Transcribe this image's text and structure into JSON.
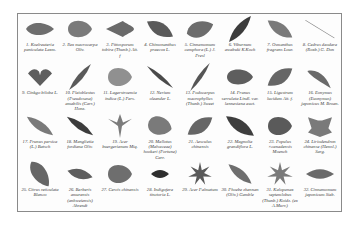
{
  "figure": {
    "specimens": [
      {
        "n": "1. Koelreuteria paniculata Laxm.",
        "shape": "ovate",
        "color": "#6e6e6e",
        "rot": 0,
        "w": 28,
        "h": 14
      },
      {
        "n": "2. Ilex macrocarpa Oliv.",
        "shape": "round",
        "color": "#7a7a7a",
        "rot": 0,
        "w": 24,
        "h": 20
      },
      {
        "n": "3. Pittosporum tobira (Thunb.) Ait. f",
        "shape": "arrow",
        "color": "#6a6a6a",
        "rot": 0,
        "w": 28,
        "h": 16
      },
      {
        "n": "4. Chimonanthus praecox L.",
        "shape": "elliptic",
        "color": "#5a5a5a",
        "rot": 30,
        "w": 30,
        "h": 16
      },
      {
        "n": "5. Cinnamomum camphora (L.) J. Presl",
        "shape": "ovate",
        "color": "#6c6c6c",
        "rot": -20,
        "w": 28,
        "h": 18
      },
      {
        "n": "6. Viburnum awabuki K.Koch",
        "shape": "lanceolate",
        "color": "#3c3c3c",
        "rot": -50,
        "w": 34,
        "h": 12
      },
      {
        "n": "7. Osmanthus fragrans Lour.",
        "shape": "elliptic",
        "color": "#7a7a7a",
        "rot": 35,
        "w": 30,
        "h": 14
      },
      {
        "n": "8. Cedrus deodara (Roxb.) G. Don",
        "shape": "needle",
        "color": "#7d7d7d",
        "rot": 30,
        "w": 34,
        "h": 2
      },
      {
        "n": "9. Ginkgo biloba L.",
        "shape": "fan",
        "color": "#5e5e5e",
        "rot": 0,
        "w": 24,
        "h": 18
      },
      {
        "n": "10. Pleioblastus (Pseudosasa) amabilis (Carr.) Honz.",
        "shape": "lanceolate",
        "color": "#5a5a5a",
        "rot": -50,
        "w": 34,
        "h": 8
      },
      {
        "n": "11. Lagerstroemia indica (L.) Pers.",
        "shape": "round",
        "color": "#909090",
        "rot": 0,
        "w": 24,
        "h": 22
      },
      {
        "n": "12. Nerium oleander L.",
        "shape": "lanceolate",
        "color": "#4a4a4a",
        "rot": 40,
        "w": 34,
        "h": 6
      },
      {
        "n": "13. Podocarpus macrophyllus (Thunb.) Sweet",
        "shape": "lanceolate",
        "color": "#555555",
        "rot": -55,
        "w": 34,
        "h": 6
      },
      {
        "n": "14. Prunus serrulata Lindl. var. lannesiana auct.",
        "shape": "round",
        "color": "#5e5e5e",
        "rot": 0,
        "w": 26,
        "h": 18
      },
      {
        "n": "15. Ligustrum lucidum Ait. f.",
        "shape": "elliptic",
        "color": "#666666",
        "rot": -35,
        "w": 30,
        "h": 16
      },
      {
        "n": "16. Eonymus (Euonymus) japonicus M. Broan.",
        "shape": "half",
        "color": "#6a6a6a",
        "rot": 20,
        "w": 28,
        "h": 14
      },
      {
        "n": "17. Prunus persica (L.) Batsch",
        "shape": "lanceolate",
        "color": "#7a7a7a",
        "rot": 35,
        "w": 32,
        "h": 12
      },
      {
        "n": "18. Manglietia fordiana Oliv.",
        "shape": "lanceolate",
        "color": "#3c3c3c",
        "rot": 35,
        "w": 32,
        "h": 10
      },
      {
        "n": "19. Acer buergerianum Miq.",
        "shape": "trident",
        "color": "#7c7c7c",
        "rot": 0,
        "w": 24,
        "h": 24
      },
      {
        "n": "20. Mallotus (Malvaceae) hookeri (Fortune) Carr.",
        "shape": "round",
        "color": "#7a7a7a",
        "rot": 15,
        "w": 24,
        "h": 22
      },
      {
        "n": "21. Aesculus chinensis",
        "shape": "elliptic",
        "color": "#666666",
        "rot": -35,
        "w": 30,
        "h": 16
      },
      {
        "n": "22. Magnolia grandiflora L.",
        "shape": "elliptic",
        "color": "#3e3e3e",
        "rot": 35,
        "w": 34,
        "h": 14
      },
      {
        "n": "23. Populus ×canadensis Moench",
        "shape": "round",
        "color": "#5a5a5a",
        "rot": 0,
        "w": 24,
        "h": 22
      },
      {
        "n": "24. Liriodendron chinense (Hemsl.) Sarg.",
        "shape": "tulip",
        "color": "#7a7a7a",
        "rot": 0,
        "w": 24,
        "h": 22
      },
      {
        "n": "25. Citrus reticulata Blanco",
        "shape": "ovate",
        "color": "#666666",
        "rot": 55,
        "w": 30,
        "h": 16
      },
      {
        "n": "26. Berberis amurensis (anhweiensis) Ahrendt",
        "shape": "elliptic",
        "color": "#5e5e5e",
        "rot": 15,
        "w": 26,
        "h": 12
      },
      {
        "n": "27. Cercis chinensis",
        "shape": "round",
        "color": "#6e6e6e",
        "rot": 0,
        "w": 24,
        "h": 22
      },
      {
        "n": "28. Indigofera tinctoria L.",
        "shape": "elliptic",
        "color": "#2e2e2e",
        "rot": 0,
        "w": 18,
        "h": 10
      },
      {
        "n": "29. Acer Palmatum",
        "shape": "star",
        "color": "#5a5a5a",
        "rot": 0,
        "w": 24,
        "h": 24
      },
      {
        "n": "30. Phoebe zhennan (Oliv.) Gamble",
        "shape": "lanceolate",
        "color": "#6e6e6e",
        "rot": 40,
        "w": 30,
        "h": 12
      },
      {
        "n": "31. Kalopanax septemlobus (Thunb.) Koidz. (ex A.Murr.)",
        "shape": "star",
        "color": "#7a7a7a",
        "rot": 0,
        "w": 26,
        "h": 24
      },
      {
        "n": "32. Cinnamomum japonicum Sieb.",
        "shape": "elliptic",
        "color": "#6a6a6a",
        "rot": 0,
        "w": 28,
        "h": 12
      }
    ]
  }
}
